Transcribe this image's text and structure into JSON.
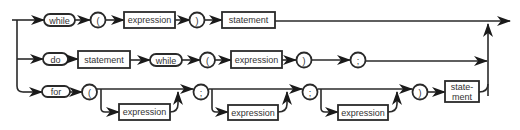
{
  "diagram": {
    "type": "syntax-diagram",
    "colors": {
      "line": "#2a2a2a",
      "arrow": "#1a1a1a",
      "text": "#333333",
      "background": "#ffffff"
    },
    "rows": {
      "while": {
        "keyword": "while",
        "open_paren": "(",
        "expression": "expression",
        "close_paren": ")",
        "statement": "statement"
      },
      "do": {
        "keyword": "do",
        "statement": "statement",
        "while_keyword": "while",
        "open_paren": "(",
        "expression": "expression",
        "close_paren": ")",
        "semicolon": ";"
      },
      "for": {
        "keyword": "for",
        "open_paren": "(",
        "init_expression": "expression",
        "semicolon1": ";",
        "cond_expression": "expression",
        "semicolon2": ";",
        "incr_expression": "expression",
        "close_paren": ")",
        "statement_line1": "state-",
        "statement_line2": "ment"
      }
    }
  }
}
